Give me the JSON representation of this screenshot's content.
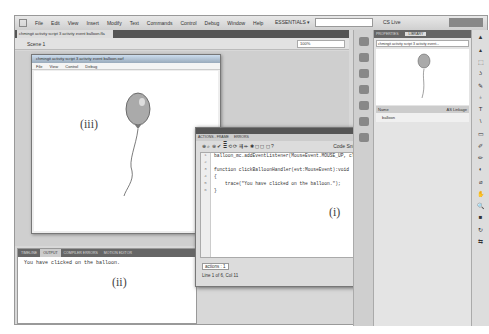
{
  "menubar": {
    "items": [
      "File",
      "Edit",
      "View",
      "Insert",
      "Modify",
      "Text",
      "Commands",
      "Control",
      "Debug",
      "Window",
      "Help"
    ],
    "workspace": "ESSENTIALS ▾",
    "cs_live": "CS Live"
  },
  "document": {
    "tab": "chmingit activity script 3 activity event balloon.fla",
    "scene": "Scene 1",
    "zoom": "100%"
  },
  "swf_window": {
    "title": "chmingit activity script 3 activity event balloon.swf",
    "menu": [
      "File",
      "View",
      "Control",
      "Debug"
    ],
    "label": "(iii)"
  },
  "output_panel": {
    "tabs": [
      "TIMELINE",
      "OUTPUT",
      "COMPILER ERRORS",
      "MOTION EDITOR"
    ],
    "active_tab": "OUTPUT",
    "text": "You have clicked on the balloon.",
    "label": "(ii)"
  },
  "actions_panel": {
    "tabs": [
      "ACTIONS - FRAME",
      "ERRORS"
    ],
    "code_snippets": "Code Snippets",
    "lines": [
      "balloon_mc.addEventListener(MouseEvent.MOUSE_UP, clickBalloonHandler);",
      "",
      "function clickBalloonHandler(evt:MouseEvent):void",
      "{",
      "    trace(\"You have clicked on the balloon.\");",
      "}"
    ],
    "line_numbers": [
      "1",
      "2",
      "3",
      "4",
      "5",
      "6"
    ],
    "file_tab": "actions : 1",
    "status": "Line 1 of 6, Col 11",
    "label": "(i)"
  },
  "library_panel": {
    "tabs": [
      "PROPERTIES",
      "LIBRARY"
    ],
    "active_tab": "LIBRARY",
    "dropdown": "chmingit activity script 3 activity event...",
    "header_name": "Name",
    "header_linkage": "AS Linkage",
    "items": [
      "balloon"
    ]
  },
  "tools": [
    "▲",
    "▴",
    "⬚",
    "ʖ",
    "✎",
    "♁",
    "T",
    "\\",
    "▭",
    "✐",
    "✏",
    "◐",
    "⌀",
    "✋",
    "🔍",
    "■",
    "↻",
    "⇆"
  ]
}
